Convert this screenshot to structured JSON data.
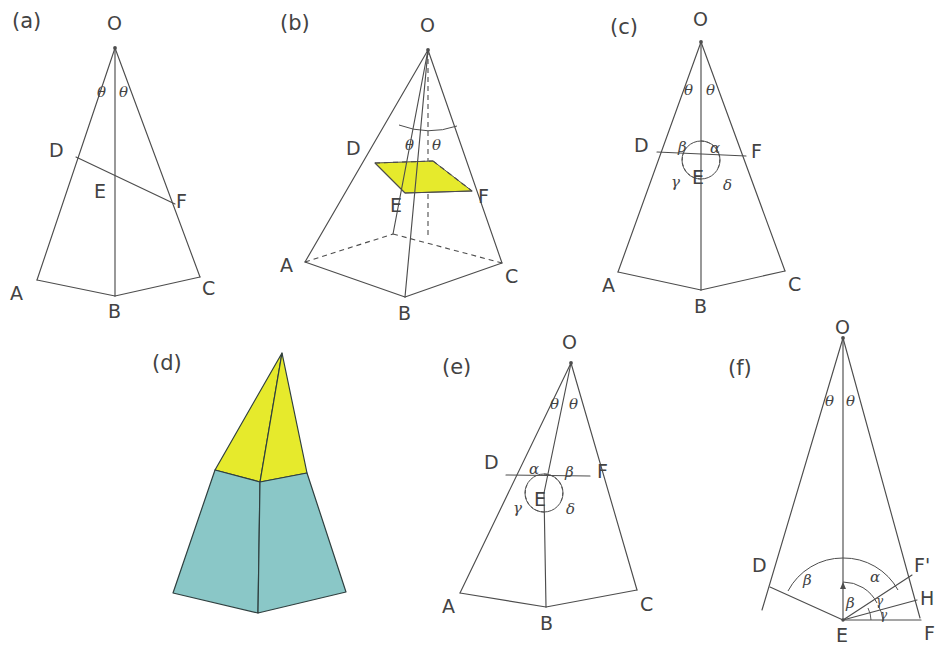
{
  "figure": {
    "background_color": "#ffffff",
    "line_color": "#4d4d4d",
    "fill_yellow": "#e6ea2c",
    "fill_teal": "#8ac7c7",
    "width": 949,
    "height": 664
  },
  "panels": [
    {
      "id": "a",
      "label": "(a)",
      "kind": "2d-triangle-section",
      "description": "Plane triangle O-A-C with apex O, base A-B-C and oblique cut line D-E-F",
      "points": [
        "O",
        "D",
        "E",
        "F",
        "A",
        "B",
        "C"
      ],
      "angles": [
        "θ",
        "θ"
      ]
    },
    {
      "id": "b",
      "label": "(b)",
      "kind": "3d-pyramid-shaded-section",
      "description": "Perspective pyramid with hidden edges dashed and a yellow shaded oblique cut quadrilateral D-E-F",
      "points": [
        "O",
        "D",
        "E",
        "F",
        "A",
        "B",
        "C"
      ],
      "angles": [
        "θ",
        "θ"
      ],
      "shaded_region_color": "#e6ea2c"
    },
    {
      "id": "c",
      "label": "(c)",
      "kind": "2d-triangle-angles-at-E",
      "description": "Same triangle as (a) with the four angles around point E marked",
      "points": [
        "O",
        "D",
        "E",
        "F",
        "A",
        "B",
        "C"
      ],
      "angles": [
        "θ",
        "θ",
        "β",
        "α",
        "γ",
        "δ"
      ],
      "angle_positions": {
        "upper_left": "β",
        "upper_right": "α",
        "lower_left": "γ",
        "lower_right": "δ"
      }
    },
    {
      "id": "d",
      "label": "(d)",
      "kind": "3d-pyramid-solid",
      "description": "Solid shaded pyramid: yellow upper apex portion above the cut, teal lower frustum below",
      "upper_color": "#e6ea2c",
      "lower_color": "#8ac7c7"
    },
    {
      "id": "e",
      "label": "(e)",
      "kind": "2d-triangle-angles-at-E",
      "description": "Triangle with angles around E labelled with alpha and beta exchanged relative to (c)",
      "points": [
        "O",
        "D",
        "E",
        "F",
        "A",
        "B",
        "C"
      ],
      "angles": [
        "θ",
        "θ",
        "α",
        "β",
        "γ",
        "δ"
      ],
      "angle_positions": {
        "upper_left": "α",
        "upper_right": "β",
        "lower_left": "γ",
        "lower_right": "δ"
      }
    },
    {
      "id": "f",
      "label": "(f)",
      "kind": "2d-angle-detail",
      "description": "Enlarged detail at vertex E showing rays to D, O, F', H and F with marked angles",
      "points": [
        "O",
        "D",
        "E",
        "F'",
        "H",
        "F"
      ],
      "angles": [
        "θ",
        "θ",
        "β",
        "α",
        "β",
        "γ",
        "γ"
      ]
    }
  ],
  "labels": {
    "panel_a": "(a)",
    "panel_b": "(b)",
    "panel_c": "(c)",
    "panel_d": "(d)",
    "panel_e": "(e)",
    "panel_f": "(f)",
    "O": "O",
    "A": "A",
    "B": "B",
    "C": "C",
    "D": "D",
    "E": "E",
    "F": "F",
    "F_prime": "F'",
    "H": "H",
    "theta": "θ",
    "alpha": "α",
    "beta": "β",
    "gamma": "γ",
    "delta": "δ"
  }
}
